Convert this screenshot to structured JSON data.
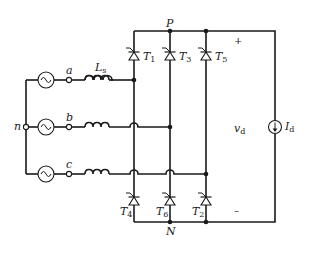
{
  "diagram": {
    "type": "three-phase thyristor bridge rectifier",
    "colors": {
      "line": "#1a1a1a",
      "background": "#ffffff"
    },
    "nodes": {
      "neutral": "n",
      "phase_a": "a",
      "phase_b": "b",
      "phase_c": "c",
      "positive_rail": "P",
      "negative_rail": "N"
    },
    "inductor": {
      "label": "L",
      "subscript": "s"
    },
    "thyristors_top": [
      {
        "label": "T",
        "subscript": "1"
      },
      {
        "label": "T",
        "subscript": "3"
      },
      {
        "label": "T",
        "subscript": "5"
      }
    ],
    "thyristors_bottom": [
      {
        "label": "T",
        "subscript": "4"
      },
      {
        "label": "T",
        "subscript": "6"
      },
      {
        "label": "T",
        "subscript": "2"
      }
    ],
    "output": {
      "voltage_label": "v",
      "voltage_subscript": "d",
      "current_label": "I",
      "current_subscript": "d",
      "plus_sign": "+",
      "minus_sign": "–"
    },
    "components": {
      "ac_sources": [
        "sine-source-a",
        "sine-source-b",
        "sine-source-c"
      ],
      "current_source": "dc-current-source-arrow-down"
    }
  }
}
